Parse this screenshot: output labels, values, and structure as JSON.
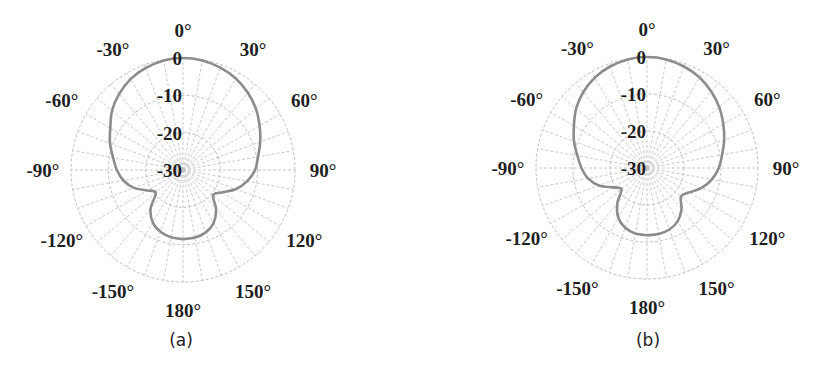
{
  "chart_data": [
    {
      "type": "polar",
      "caption": "(a)",
      "center": [
        183,
        170
      ],
      "radius": 112,
      "r_ticks": [
        0,
        -10,
        -20,
        -30
      ],
      "r_tick_labels": [
        "0",
        "-10",
        "-20",
        "-30"
      ],
      "rlim": [
        -30,
        0
      ],
      "angle_labels": [
        "0°",
        "30°",
        "60°",
        "90°",
        "120°",
        "150°",
        "180°",
        "-150°",
        "-120°",
        "-90°",
        "-60°",
        "-30°"
      ],
      "angle_label_values": [
        0,
        30,
        60,
        90,
        120,
        150,
        180,
        -150,
        -120,
        -90,
        -60,
        -30
      ],
      "angular_grid_step_deg": 10,
      "grid": true,
      "series": [
        {
          "name": "radiation pattern",
          "color": "#8c8c8c",
          "angles_deg": [
            -180,
            -170,
            -160,
            -150,
            -140,
            -130,
            -120,
            -110,
            -100,
            -90,
            -80,
            -70,
            -60,
            -50,
            -40,
            -30,
            -20,
            -10,
            0,
            10,
            20,
            30,
            40,
            50,
            60,
            70,
            80,
            90,
            100,
            110,
            120,
            130,
            140,
            150,
            160,
            170,
            180
          ],
          "values_db": [
            -11.5,
            -11.7,
            -12.4,
            -13.8,
            -16.5,
            -20.5,
            -19.0,
            -16.0,
            -13.8,
            -12.3,
            -11.0,
            -9.2,
            -7.5,
            -5.2,
            -3.4,
            -1.9,
            -0.9,
            -0.2,
            0,
            -0.2,
            -0.8,
            -1.7,
            -3.0,
            -4.5,
            -6.3,
            -8.0,
            -9.6,
            -10.7,
            -12.6,
            -15.0,
            -18.0,
            -19.5,
            -16.2,
            -13.6,
            -12.2,
            -11.6,
            -11.5
          ]
        }
      ]
    },
    {
      "type": "polar",
      "caption": "(b)",
      "center": [
        647,
        168
      ],
      "radius": 111,
      "r_ticks": [
        0,
        -10,
        -20,
        -30
      ],
      "r_tick_labels": [
        "0",
        "-10",
        "-20",
        "-30"
      ],
      "rlim": [
        -30,
        0
      ],
      "angle_labels": [
        "0°",
        "30°",
        "60°",
        "90°",
        "120°",
        "150°",
        "180°",
        "-150°",
        "-120°",
        "-90°",
        "-60°",
        "-30°"
      ],
      "angle_label_values": [
        0,
        30,
        60,
        90,
        120,
        150,
        180,
        -150,
        -120,
        -90,
        -60,
        -30
      ],
      "angular_grid_step_deg": 10,
      "grid": true,
      "series": [
        {
          "name": "radiation pattern",
          "color": "#8c8c8c",
          "angles_deg": [
            -180,
            -170,
            -160,
            -150,
            -140,
            -130,
            -120,
            -110,
            -100,
            -90,
            -80,
            -70,
            -60,
            -50,
            -40,
            -30,
            -20,
            -10,
            0,
            10,
            20,
            30,
            40,
            50,
            60,
            70,
            80,
            90,
            100,
            110,
            120,
            130,
            140,
            150,
            160,
            170,
            180
          ],
          "values_db": [
            -11.8,
            -12.0,
            -12.8,
            -14.5,
            -17.5,
            -21.0,
            -19.5,
            -16.2,
            -13.8,
            -12.3,
            -10.9,
            -9.0,
            -7.2,
            -5.0,
            -3.2,
            -1.8,
            -0.8,
            -0.2,
            0,
            -0.2,
            -0.8,
            -1.7,
            -3.0,
            -4.5,
            -6.2,
            -7.8,
            -9.4,
            -10.6,
            -12.2,
            -14.3,
            -16.8,
            -18.0,
            -15.5,
            -13.4,
            -12.3,
            -11.9,
            -11.8
          ]
        }
      ]
    }
  ],
  "figure": {
    "panels": [
      {
        "caption": "(a)"
      },
      {
        "caption": "(b)"
      }
    ]
  }
}
